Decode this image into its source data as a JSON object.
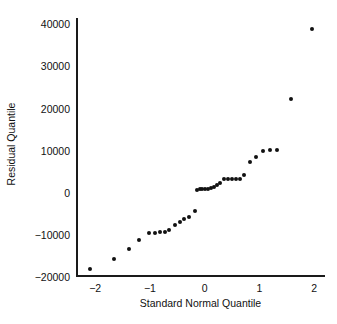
{
  "chart_data": {
    "type": "scatter",
    "title": "",
    "xlabel": "Standard Normal Quantile",
    "ylabel": "Residual Quantile",
    "xlim": [
      -2.35,
      2.2
    ],
    "ylim": [
      -20000,
      41500
    ],
    "xticks": [
      -2,
      -1,
      0,
      1,
      2
    ],
    "xtick_labels": [
      "−2",
      "−1",
      "0",
      "1",
      "2"
    ],
    "yticks": [
      -20000,
      -10000,
      0,
      10000,
      20000,
      30000,
      40000
    ],
    "ytick_labels": [
      "−20000",
      "−10000",
      "0",
      "10000",
      "20000",
      "30000",
      "40000"
    ],
    "grid": false,
    "legend": "none",
    "marker": "filled-circle",
    "marker_color": "#111111",
    "series": [
      {
        "name": "residual-quantiles",
        "x": [
          -2.09,
          -1.66,
          -1.38,
          -1.19,
          -1.02,
          -0.9,
          -0.81,
          -0.73,
          -0.65,
          -0.54,
          -0.45,
          -0.37,
          -0.29,
          -0.18,
          -0.14,
          -0.09,
          -0.04,
          0.01,
          0.06,
          0.12,
          0.17,
          0.23,
          0.29,
          0.36,
          0.43,
          0.5,
          0.57,
          0.64,
          0.72,
          0.83,
          0.94,
          1.06,
          1.2,
          1.33,
          1.57,
          1.97
        ],
        "y": [
          -18200,
          -15700,
          -13400,
          -11300,
          -9600,
          -9550,
          -9400,
          -9250,
          -8900,
          -7600,
          -7000,
          -6200,
          -5800,
          -4400,
          700,
          800,
          850,
          900,
          1000,
          1150,
          1400,
          1900,
          2400,
          3200,
          3300,
          3350,
          3300,
          3250,
          4200,
          7200,
          8500,
          9950,
          10150,
          10200,
          22200,
          38800
        ]
      }
    ]
  }
}
